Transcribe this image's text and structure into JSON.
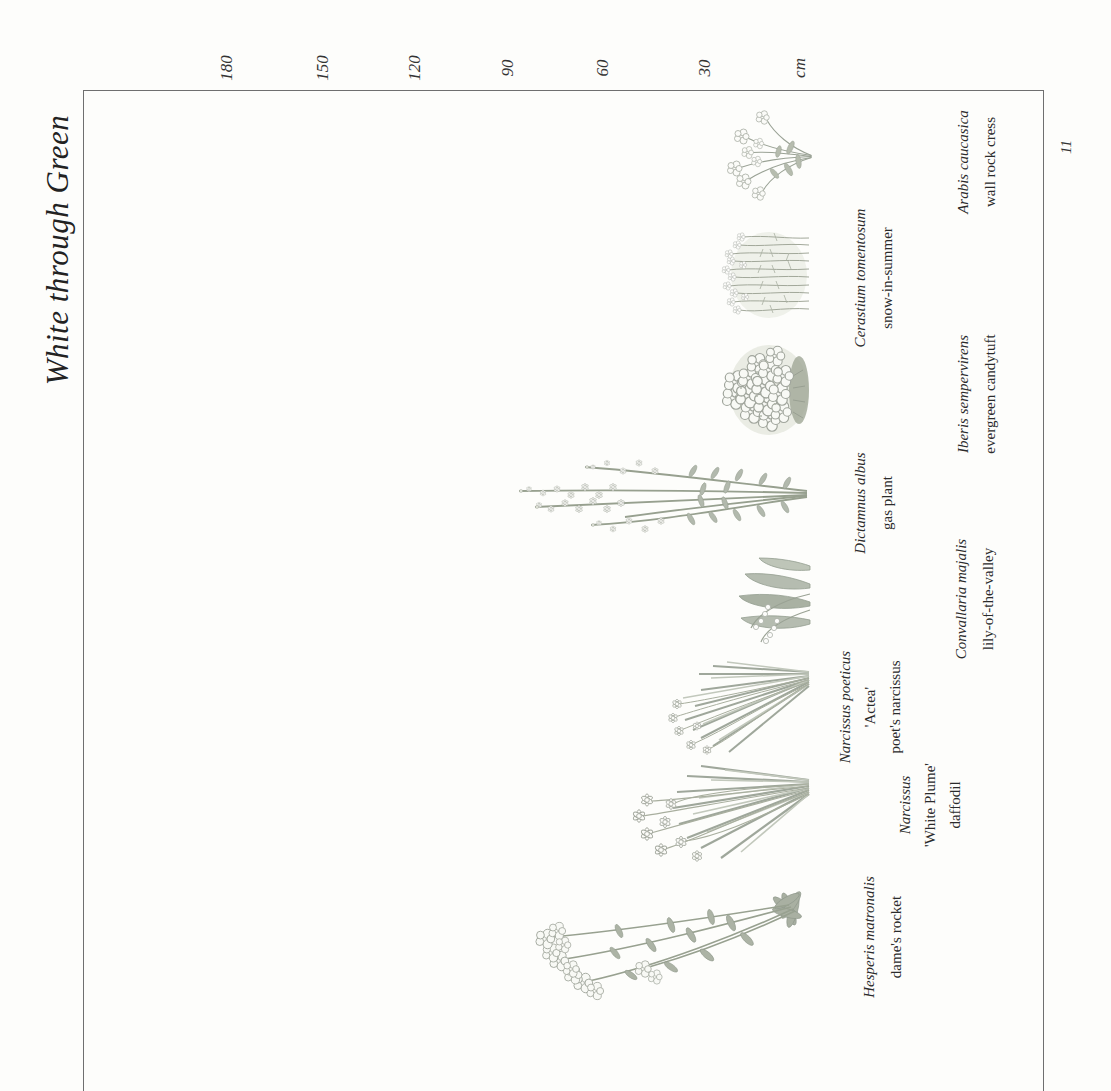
{
  "page": {
    "title": "White through Green",
    "page_number": "11"
  },
  "scale": {
    "unit": "cm",
    "labels": [
      "180",
      "150",
      "120",
      "90",
      "60",
      "30",
      "cm"
    ],
    "tick_values_cm": [
      180,
      150,
      120,
      90,
      60,
      30
    ]
  },
  "colors": {
    "ink": "#2e2e2e",
    "frame_line": "#6f6f6f",
    "foliage": "#a8aea0",
    "foliage_light": "#c3c9bc",
    "flower": "#fbfbf8"
  },
  "plants": [
    {
      "botanical": "Arabis caucasica",
      "common": "wall rock cress",
      "depicted_height_cm": 28
    },
    {
      "botanical": "Cerastium tomentosum",
      "common": "snow-in-summer",
      "depicted_height_cm": 30
    },
    {
      "botanical": "Iberis sempervirens",
      "common": "evergreen candytuft",
      "depicted_height_cm": 30
    },
    {
      "botanical": "Dictamnus albus",
      "common": "gas plant",
      "depicted_height_cm": 100
    },
    {
      "botanical": "Convallaria majalis",
      "common": "lily-of-the-valley",
      "depicted_height_cm": 25
    },
    {
      "botanical": "Narcissus poeticus",
      "cultivar": "'Actea'",
      "common": "poet's narcissus",
      "depicted_height_cm": 50
    },
    {
      "botanical": "Narcissus",
      "cultivar": "'White Plume'",
      "common": "daffodil",
      "depicted_height_cm": 60
    },
    {
      "botanical": "Hesperis matronalis",
      "common": "dame's rocket",
      "depicted_height_cm": 90
    }
  ]
}
